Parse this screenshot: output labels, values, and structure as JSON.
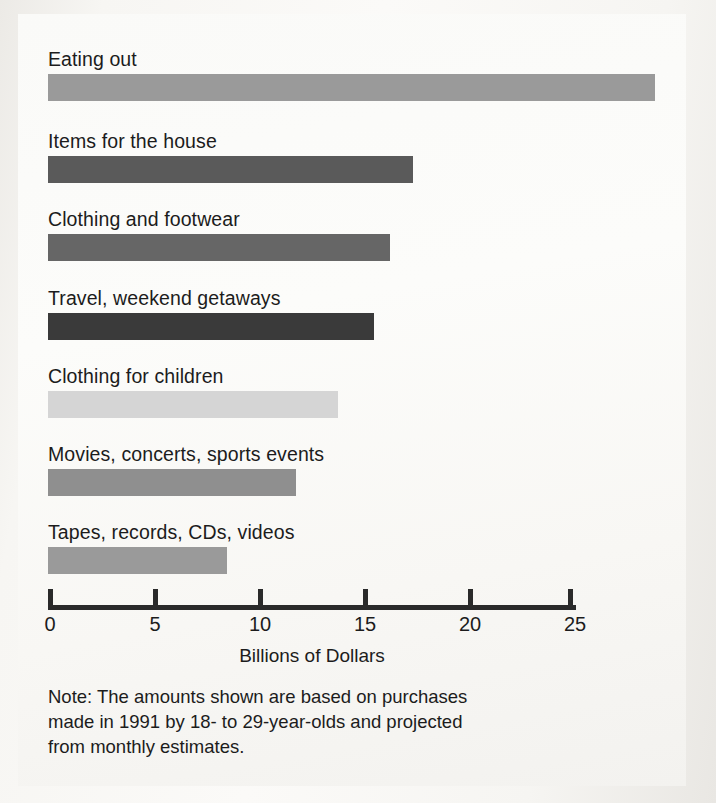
{
  "chart_data": {
    "type": "bar",
    "orientation": "horizontal",
    "title": "",
    "xlabel": "Billions of Dollars",
    "ylabel": "",
    "xlim": [
      0,
      25
    ],
    "xticks": [
      0,
      5,
      10,
      15,
      20,
      25
    ],
    "xtick_labels": [
      "0",
      "5",
      "10",
      "15",
      "20",
      "25"
    ],
    "grid": false,
    "legend": "none",
    "categories": [
      "Eating out",
      "Items for the house",
      "Clothing and footwear",
      "Travel, weekend getaways",
      "Clothing for children",
      "Movies, concerts, sports events",
      "Tapes, records, CDs, videos"
    ],
    "values": [
      28.9,
      17.4,
      16.3,
      15.5,
      13.8,
      11.8,
      8.5
    ],
    "bar_colors": [
      "#9a9a9a",
      "#5a5a5a",
      "#666666",
      "#3a3a3a",
      "#d5d5d5",
      "#8f8f8f",
      "#9a9a9a"
    ],
    "annotations": [
      "Note: The amounts shown are based on purchases made in 1991 by 18- to 29-year-olds and projected from monthly estimates."
    ]
  },
  "axis": {
    "title": "Billions of Dollars"
  },
  "note": {
    "line1": "Note: The amounts shown are based on purchases",
    "line2": "made in 1991 by 18- to 29-year-olds and projected",
    "line3": "from monthly estimates."
  }
}
